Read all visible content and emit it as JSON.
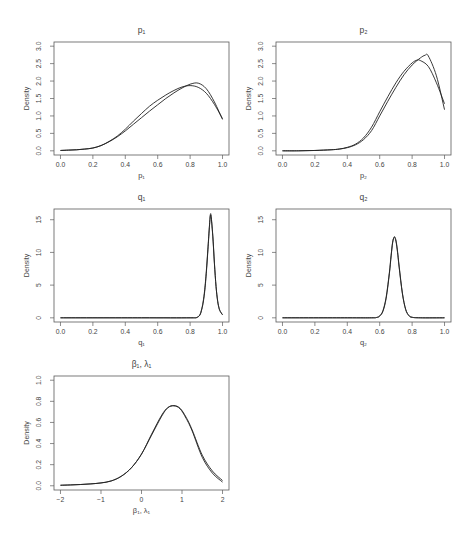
{
  "figure": {
    "layout": "3 rows x 2 columns, 5 density panels",
    "colors": {
      "curve": "#222222",
      "frame": "#5a5a5a",
      "text": "#444444",
      "background": "#ffffff"
    }
  },
  "chart_data": [
    {
      "type": "line",
      "title": "p₁",
      "xlabel": "p₁",
      "ylabel": "Density",
      "xlim": [
        0,
        1
      ],
      "ylim": [
        0,
        3
      ],
      "xticks": [
        0,
        0.2,
        0.4,
        0.6,
        0.8,
        1.0
      ],
      "xtick_labels": [
        "0.0",
        "0.2",
        "0.4",
        "0.6",
        "0.8",
        "1.0"
      ],
      "yticks": [
        0,
        0.5,
        1.0,
        1.5,
        2.0,
        2.5,
        3.0
      ],
      "ytick_labels": [
        "0.0",
        "0.5",
        "1.0",
        "1.5",
        "2.0",
        "2.5",
        "3.0"
      ],
      "grid": false,
      "legend": null,
      "series": [
        {
          "name": "curve 1",
          "x": [
            0,
            0.05,
            0.1,
            0.15,
            0.2,
            0.25,
            0.3,
            0.35,
            0.4,
            0.45,
            0.5,
            0.55,
            0.6,
            0.65,
            0.7,
            0.75,
            0.8,
            0.85,
            0.9,
            0.95,
            1.0
          ],
          "y": [
            0.01,
            0.02,
            0.03,
            0.05,
            0.08,
            0.15,
            0.26,
            0.4,
            0.57,
            0.76,
            0.95,
            1.14,
            1.32,
            1.5,
            1.66,
            1.8,
            1.91,
            1.94,
            1.78,
            1.4,
            0.9
          ]
        },
        {
          "name": "curve 2",
          "x": [
            0,
            0.05,
            0.1,
            0.15,
            0.2,
            0.25,
            0.3,
            0.35,
            0.4,
            0.45,
            0.5,
            0.55,
            0.6,
            0.65,
            0.7,
            0.75,
            0.8,
            0.85,
            0.9,
            0.95,
            1.0
          ],
          "y": [
            0.01,
            0.02,
            0.03,
            0.05,
            0.08,
            0.15,
            0.27,
            0.42,
            0.62,
            0.85,
            1.07,
            1.28,
            1.45,
            1.6,
            1.73,
            1.83,
            1.87,
            1.82,
            1.65,
            1.33,
            0.92
          ]
        }
      ]
    },
    {
      "type": "line",
      "title": "p₂",
      "xlabel": "p₂",
      "ylabel": "Density",
      "xlim": [
        0,
        1
      ],
      "ylim": [
        0,
        3
      ],
      "xticks": [
        0,
        0.2,
        0.4,
        0.6,
        0.8,
        1.0
      ],
      "xtick_labels": [
        "0.0",
        "0.2",
        "0.4",
        "0.6",
        "0.8",
        "1.0"
      ],
      "yticks": [
        0,
        0.5,
        1.0,
        1.5,
        2.0,
        2.5,
        3.0
      ],
      "ytick_labels": [
        "0.0",
        "0.5",
        "1.0",
        "1.5",
        "2.0",
        "2.5",
        "3.0"
      ],
      "grid": false,
      "legend": null,
      "series": [
        {
          "name": "curve 1",
          "x": [
            0,
            0.1,
            0.2,
            0.3,
            0.35,
            0.4,
            0.45,
            0.5,
            0.55,
            0.6,
            0.65,
            0.7,
            0.75,
            0.8,
            0.85,
            0.88,
            0.9,
            0.95,
            1.0
          ],
          "y": [
            0,
            0,
            0.01,
            0.03,
            0.05,
            0.09,
            0.17,
            0.32,
            0.58,
            1.0,
            1.42,
            1.82,
            2.18,
            2.46,
            2.66,
            2.74,
            2.72,
            2.15,
            1.18
          ]
        },
        {
          "name": "curve 2",
          "x": [
            0,
            0.1,
            0.2,
            0.3,
            0.35,
            0.4,
            0.45,
            0.5,
            0.55,
            0.6,
            0.65,
            0.7,
            0.75,
            0.8,
            0.83,
            0.85,
            0.9,
            0.95,
            1.0
          ],
          "y": [
            0,
            0,
            0.01,
            0.03,
            0.05,
            0.1,
            0.19,
            0.37,
            0.68,
            1.12,
            1.55,
            1.95,
            2.28,
            2.52,
            2.6,
            2.59,
            2.42,
            1.95,
            1.35
          ]
        }
      ]
    },
    {
      "type": "line",
      "title": "q₁",
      "xlabel": "q₁",
      "ylabel": "Density",
      "xlim": [
        0,
        1
      ],
      "ylim": [
        0,
        16
      ],
      "xticks": [
        0,
        0.2,
        0.4,
        0.6,
        0.8,
        1.0
      ],
      "xtick_labels": [
        "0.0",
        "0.2",
        "0.4",
        "0.6",
        "0.8",
        "1.0"
      ],
      "yticks": [
        0,
        5,
        10,
        15
      ],
      "ytick_labels": [
        "0",
        "5",
        "10",
        "15"
      ],
      "grid": false,
      "legend": null,
      "series": [
        {
          "name": "curve 1",
          "x": [
            0,
            0.5,
            0.8,
            0.84,
            0.86,
            0.87,
            0.88,
            0.89,
            0.9,
            0.91,
            0.92,
            0.925,
            0.93,
            0.94,
            0.95,
            0.96,
            0.97,
            0.98,
            0.99,
            1.0
          ],
          "y": [
            0,
            0,
            0,
            0.05,
            0.4,
            1.1,
            2.2,
            4.0,
            6.8,
            10.4,
            14.2,
            15.8,
            15.5,
            12.6,
            8.4,
            4.8,
            2.5,
            1.3,
            0.8,
            0.45
          ]
        },
        {
          "name": "curve 2",
          "x": [
            0,
            0.5,
            0.8,
            0.84,
            0.86,
            0.87,
            0.88,
            0.89,
            0.9,
            0.91,
            0.92,
            0.925,
            0.93,
            0.94,
            0.95,
            0.96,
            0.97,
            0.98,
            0.99,
            1.0
          ],
          "y": [
            0,
            0,
            0,
            0.05,
            0.45,
            1.2,
            2.4,
            4.3,
            7.1,
            10.7,
            14.3,
            15.6,
            15.3,
            12.4,
            8.3,
            4.8,
            2.6,
            1.4,
            0.85,
            0.5
          ]
        }
      ]
    },
    {
      "type": "line",
      "title": "q₂",
      "xlabel": "q₂",
      "ylabel": "Density",
      "xlim": [
        0,
        1
      ],
      "ylim": [
        0,
        16
      ],
      "xticks": [
        0,
        0.2,
        0.4,
        0.6,
        0.8,
        1.0
      ],
      "xtick_labels": [
        "0.0",
        "0.2",
        "0.4",
        "0.6",
        "0.8",
        "1.0"
      ],
      "yticks": [
        0,
        5,
        10,
        15
      ],
      "ytick_labels": [
        "0",
        "5",
        "10",
        "15"
      ],
      "grid": false,
      "legend": null,
      "series": [
        {
          "name": "curve 1",
          "x": [
            0,
            0.4,
            0.55,
            0.58,
            0.6,
            0.62,
            0.64,
            0.66,
            0.67,
            0.68,
            0.69,
            0.7,
            0.71,
            0.72,
            0.74,
            0.76,
            0.78,
            0.8,
            0.85,
            1.0
          ],
          "y": [
            0,
            0,
            0,
            0.05,
            0.25,
            1.0,
            3.0,
            6.8,
            9.3,
            11.5,
            12.4,
            11.9,
            10.2,
            7.9,
            3.8,
            1.3,
            0.35,
            0.08,
            0,
            0
          ]
        },
        {
          "name": "curve 2",
          "x": [
            0,
            0.4,
            0.55,
            0.58,
            0.6,
            0.62,
            0.64,
            0.66,
            0.67,
            0.68,
            0.69,
            0.7,
            0.71,
            0.72,
            0.74,
            0.76,
            0.78,
            0.8,
            0.85,
            1.0
          ],
          "y": [
            0,
            0,
            0,
            0.05,
            0.3,
            1.1,
            3.2,
            7.0,
            9.5,
            11.6,
            12.3,
            11.7,
            10.0,
            7.7,
            3.7,
            1.3,
            0.35,
            0.08,
            0,
            0
          ]
        }
      ]
    },
    {
      "type": "line",
      "title": "β₁, λ₁",
      "xlabel": "β₁, λ₁",
      "ylabel": "Density",
      "xlim": [
        -2,
        2
      ],
      "ylim": [
        0,
        1
      ],
      "xticks": [
        -2,
        -1,
        0,
        1,
        2
      ],
      "xtick_labels": [
        "−2",
        "−1",
        "0",
        "1",
        "2"
      ],
      "yticks": [
        0,
        0.2,
        0.4,
        0.6,
        0.8,
        1.0
      ],
      "ytick_labels": [
        "0.0",
        "0.2",
        "0.4",
        "0.6",
        "0.8",
        "1.0"
      ],
      "grid": false,
      "legend": null,
      "series": [
        {
          "name": "curve 1",
          "x": [
            -2,
            -1.75,
            -1.5,
            -1.25,
            -1,
            -0.75,
            -0.5,
            -0.25,
            0,
            0.25,
            0.5,
            0.65,
            0.8,
            0.95,
            1.1,
            1.25,
            1.5,
            1.75,
            2.0
          ],
          "y": [
            0.005,
            0.008,
            0.012,
            0.018,
            0.027,
            0.045,
            0.09,
            0.17,
            0.3,
            0.49,
            0.67,
            0.74,
            0.757,
            0.73,
            0.64,
            0.52,
            0.27,
            0.12,
            0.035
          ]
        },
        {
          "name": "curve 2",
          "x": [
            -2,
            -1.75,
            -1.5,
            -1.25,
            -1,
            -0.75,
            -0.5,
            -0.25,
            0,
            0.25,
            0.5,
            0.65,
            0.8,
            0.95,
            1.1,
            1.25,
            1.5,
            1.75,
            2.0
          ],
          "y": [
            0.005,
            0.008,
            0.012,
            0.018,
            0.027,
            0.046,
            0.09,
            0.17,
            0.3,
            0.48,
            0.66,
            0.74,
            0.76,
            0.735,
            0.65,
            0.53,
            0.29,
            0.14,
            0.05
          ]
        }
      ]
    }
  ]
}
